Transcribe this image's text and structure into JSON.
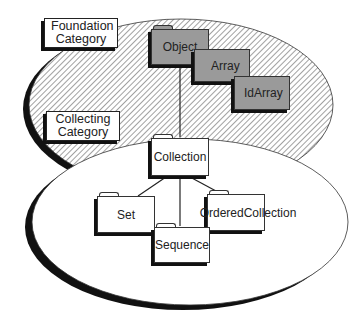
{
  "categories": {
    "foundation": {
      "line1": "Foundation",
      "line2": "Category"
    },
    "collecting": {
      "line1": "Collecting",
      "line2": "Category"
    }
  },
  "classes": {
    "object": "Object",
    "array": "Array",
    "idarray": "IdArray",
    "collection": "Collection",
    "set": "Set",
    "sequence": "Sequence",
    "ordered_collection": "OrderedCollection"
  },
  "colors": {
    "foundation_folder_fill": "#9a9a9a",
    "collecting_folder_fill": "#ffffff",
    "outline": "#222222",
    "shadow": "#111111"
  },
  "relationships": [
    {
      "from": "Object",
      "to": "Collection"
    },
    {
      "from": "Collection",
      "to": "Set"
    },
    {
      "from": "Collection",
      "to": "Sequence"
    },
    {
      "from": "Collection",
      "to": "OrderedCollection"
    }
  ]
}
